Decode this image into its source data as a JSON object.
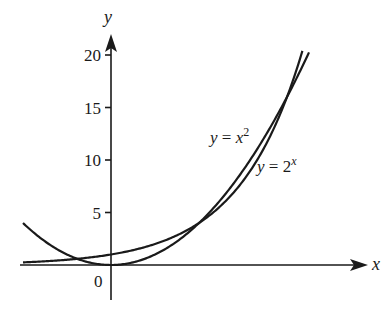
{
  "chart_data": {
    "type": "line",
    "title": "",
    "xlabel": "x",
    "ylabel": "y",
    "origin_label": "0",
    "xlim": [
      -2.1,
      5.8
    ],
    "ylim": [
      -3.5,
      22
    ],
    "yticks": [
      5,
      10,
      15,
      20
    ],
    "ytick_labels": [
      "5",
      "10",
      "15",
      "20"
    ],
    "xticks": [],
    "grid": false,
    "legend": null,
    "series": [
      {
        "name": "y = x^2",
        "label_text": "y = x",
        "label_sup": "2",
        "function": "x^2",
        "x_range": [
          -2.0,
          4.5
        ]
      },
      {
        "name": "y = 2^x",
        "label_text": "y = 2",
        "label_sup": "x",
        "function": "2^x",
        "x_range": [
          -2.0,
          4.35
        ]
      }
    ],
    "annotations": [
      "y = x^2",
      "y = 2^x"
    ],
    "intersections": [
      [
        -0.77,
        0.59
      ],
      [
        2,
        4
      ],
      [
        4,
        16
      ]
    ],
    "color": "#1a1a1a"
  }
}
